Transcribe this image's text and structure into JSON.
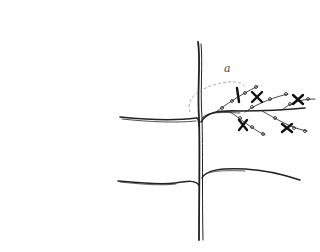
{
  "diagram": {
    "type": "pruning-sketch",
    "label": "a",
    "colors": {
      "stroke": "#222222",
      "dashed_arc": "#999999",
      "background": "#ffffff"
    },
    "elements": {
      "trunk": {
        "x": 200,
        "top": 40,
        "bottom": 240
      },
      "upper_tier": {
        "y": 118,
        "left_end_x": 120,
        "right_end_x": 305
      },
      "lower_tier": {
        "y": 182,
        "left_end_x": 118,
        "right_end_x": 300
      },
      "cut_marks": 5,
      "shoots": 6
    }
  }
}
